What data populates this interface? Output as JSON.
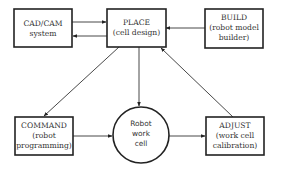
{
  "diagram": {
    "nodes": {
      "cadcam": {
        "line1": "CAD/CAM",
        "line2": "system"
      },
      "place": {
        "line1": "PLACE",
        "line2": "(cell design)"
      },
      "build": {
        "line1": "BUILD",
        "line2": "(robot model",
        "line3": "builder)"
      },
      "command": {
        "line1": "COMMAND",
        "line2": "(robot",
        "line3": "programming)"
      },
      "workcell": {
        "line1": "Robot",
        "line2": "work",
        "line3": "cell"
      },
      "adjust": {
        "line1": "ADJUST",
        "line2": "(work cell",
        "line3": "calibration)"
      }
    },
    "edges": [
      {
        "from": "CAD/CAM system",
        "to": "PLACE"
      },
      {
        "from": "PLACE",
        "to": "CAD/CAM system"
      },
      {
        "from": "BUILD",
        "to": "PLACE"
      },
      {
        "from": "PLACE",
        "to": "COMMAND"
      },
      {
        "from": "PLACE",
        "to": "Robot work cell"
      },
      {
        "from": "ADJUST",
        "to": "PLACE"
      },
      {
        "from": "COMMAND",
        "to": "Robot work cell"
      },
      {
        "from": "Robot work cell",
        "to": "ADJUST"
      }
    ],
    "colors": {
      "stroke": "#222222",
      "text": "#333333",
      "background": "#ffffff"
    }
  }
}
